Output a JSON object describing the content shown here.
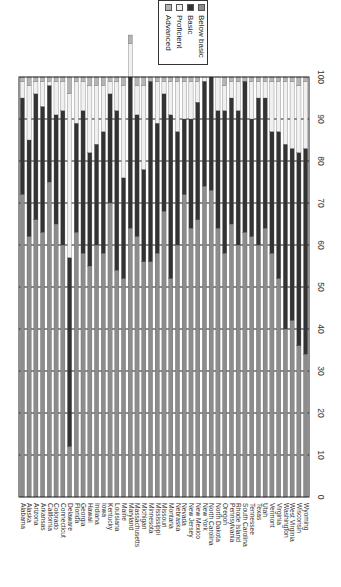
{
  "chart_data": {
    "type": "bar",
    "orientation": "rotated-horizontal-stacked",
    "title": "",
    "xlabel": "",
    "ylabel": "",
    "xlim": [
      0,
      100
    ],
    "x_ticks": [
      0,
      10,
      20,
      30,
      40,
      50,
      60,
      70,
      80,
      90,
      100
    ],
    "grid": true,
    "legend_position": "top-right",
    "categories": [
      "Alabama",
      "Alaska",
      "Arizona",
      "Arkansas",
      "California",
      "Colorado",
      "Connecticut",
      "Delaware",
      "Florida",
      "Georgia",
      "Hawaii",
      "Indiana",
      "Iowa",
      "Kentucky",
      "Louisiana",
      "Maine",
      "Maryland",
      "Massachusetts",
      "Michigan",
      "Minnesota",
      "Mississippi",
      "Missouri",
      "Montana",
      "Nebraska",
      "Nevada",
      "New Jersey",
      "New Mexico",
      "New York",
      "North Carolina",
      "North Dakota",
      "Oregon",
      "Pennsylvania",
      "Rhode Island",
      "South Carolina",
      "Tennessee",
      "Texas",
      "Utah",
      "Vermont",
      "Virginia",
      "Washington",
      "West Virginia",
      "Wisconsin",
      "Wyoming"
    ],
    "series": [
      {
        "name": "Below basic",
        "color": "#8c8c8c",
        "values": [
          72,
          62,
          66,
          63,
          75,
          65,
          60,
          12,
          63,
          58,
          55,
          60,
          58,
          70,
          54,
          52,
          64,
          62,
          56,
          56,
          58,
          68,
          52,
          60,
          72,
          64,
          66,
          74,
          73,
          64,
          58,
          65,
          60,
          63,
          62,
          60,
          64,
          58,
          52,
          40,
          42,
          36,
          34
        ]
      },
      {
        "name": "Basic",
        "color": "#333333",
        "values": [
          23,
          23,
          30,
          30,
          23,
          26,
          32,
          45,
          26,
          34,
          27,
          24,
          29,
          26,
          38,
          24,
          36,
          29,
          22,
          43,
          31,
          28,
          39,
          27,
          18,
          26,
          28,
          25,
          27,
          28,
          34,
          30,
          32,
          36,
          28,
          35,
          31,
          29,
          35,
          44,
          41,
          46,
          49
        ]
      },
      {
        "name": "Proficient",
        "color": "#f0f0f0",
        "values": [
          4,
          13,
          3,
          6,
          1,
          8,
          7,
          39,
          10,
          7,
          16,
          14,
          11,
          3,
          7,
          22,
          8,
          7,
          20,
          0,
          10,
          3,
          8,
          12,
          9,
          9,
          5,
          1,
          0,
          8,
          6,
          4,
          7,
          0,
          9,
          4,
          4,
          12,
          12,
          15,
          16,
          16,
          16
        ]
      },
      {
        "name": "Advanced",
        "color": "#b4b4b4",
        "values": [
          1,
          2,
          1,
          1,
          1,
          1,
          1,
          4,
          1,
          1,
          2,
          2,
          2,
          1,
          1,
          2,
          2,
          2,
          2,
          1,
          1,
          1,
          1,
          1,
          1,
          1,
          1,
          0,
          0,
          0,
          2,
          1,
          1,
          1,
          1,
          1,
          1,
          1,
          1,
          1,
          1,
          2,
          1
        ]
      }
    ]
  },
  "legend": {
    "items": [
      {
        "label": "Below basic",
        "color": "#8c8c8c"
      },
      {
        "label": "Basic",
        "color": "#333333"
      },
      {
        "label": "Proficient",
        "color": "#f0f0f0"
      },
      {
        "label": "Advanced",
        "color": "#b4b4b4"
      }
    ]
  },
  "layout": {
    "plot_left": 19,
    "plot_right": 309,
    "plot_top": 77,
    "plot_bottom": 497,
    "bar_width": 4.2,
    "tick_label_x": 320,
    "state_label_top": 503
  }
}
